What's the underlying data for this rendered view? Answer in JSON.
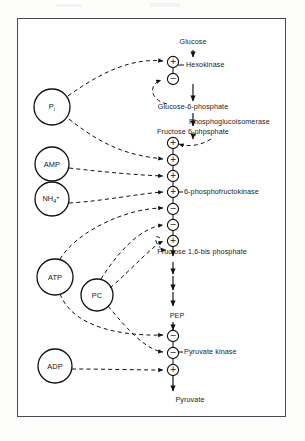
{
  "figure": {
    "type": "pathway-diagram",
    "border_color": "#4a4a52",
    "background": "#ffffff"
  },
  "pathway": {
    "metabolites": [
      {
        "id": "glucose",
        "label": "Glucose",
        "x": 193,
        "y": 45
      },
      {
        "id": "g6p",
        "label": "Glucose-6-phosphate",
        "x": 193,
        "y": 110
      },
      {
        "id": "f6p",
        "label": "Fructose 6-phpsphate",
        "x": 193,
        "y": 134
      },
      {
        "id": "fbp",
        "label": "Fructose 1,6-bis phosphate",
        "x": 202,
        "y": 248
      },
      {
        "id": "pep",
        "label": "PEP",
        "x": 177,
        "y": 318
      },
      {
        "id": "pyruvate",
        "label": "Pyruvate",
        "x": 190,
        "y": 399
      }
    ],
    "enzymes": [
      {
        "id": "hexokinase",
        "label": "Hexokinase",
        "x": 185,
        "y": 65
      },
      {
        "id": "phosphoglucoisomerase",
        "label": "Phosphoglucoisomerase",
        "x": 185,
        "y": 122
      },
      {
        "id": "pfk",
        "label": "6-phosphofructokinase",
        "x": 185,
        "y": 192
      },
      {
        "id": "pyruvate_kinase",
        "label": "Pyruvate kinase",
        "x": 185,
        "y": 352
      }
    ]
  },
  "effectors": [
    {
      "id": "pi",
      "label": "P",
      "sub": "i",
      "sup": "",
      "x": 52,
      "y": 107,
      "r": 18
    },
    {
      "id": "amp",
      "label": "AMP",
      "sub": "",
      "sup": "",
      "x": 52,
      "y": 164,
      "r": 17
    },
    {
      "id": "nh4",
      "label": "NH",
      "sub": "4",
      "sup": "+",
      "x": 52,
      "y": 199,
      "r": 17
    },
    {
      "id": "atp",
      "label": "ATP",
      "sub": "",
      "sup": "",
      "x": 55,
      "y": 277,
      "r": 18
    },
    {
      "id": "pc",
      "label": "PC",
      "sub": "",
      "sup": "",
      "x": 97,
      "y": 295,
      "r": 16
    },
    {
      "id": "adp",
      "label": "ADP",
      "sub": "",
      "sup": "",
      "x": 55,
      "y": 366,
      "r": 17
    }
  ],
  "regulation_nodes": [
    {
      "id": "hk-plus",
      "sign": "+",
      "x": 173,
      "y": 62,
      "enzyme": "hexokinase"
    },
    {
      "id": "hk-minus",
      "sign": "-",
      "x": 173,
      "y": 79,
      "enzyme": "hexokinase"
    },
    {
      "id": "pfk-1",
      "sign": "+",
      "x": 173,
      "y": 143,
      "enzyme": "pfk"
    },
    {
      "id": "pfk-2",
      "sign": "+",
      "x": 173,
      "y": 160,
      "enzyme": "pfk"
    },
    {
      "id": "pfk-3",
      "sign": "+",
      "x": 173,
      "y": 176,
      "enzyme": "pfk"
    },
    {
      "id": "pfk-4",
      "sign": "+",
      "x": 173,
      "y": 192,
      "enzyme": "pfk"
    },
    {
      "id": "pfk-5",
      "sign": "-",
      "x": 173,
      "y": 209,
      "enzyme": "pfk"
    },
    {
      "id": "pfk-6",
      "sign": "-",
      "x": 173,
      "y": 225,
      "enzyme": "pfk"
    },
    {
      "id": "pfk-7",
      "sign": "+",
      "x": 173,
      "y": 241,
      "enzyme": "pfk"
    },
    {
      "id": "pk-1",
      "sign": "-",
      "x": 173,
      "y": 336,
      "enzyme": "pyruvate_kinase"
    },
    {
      "id": "pk-2",
      "sign": "-",
      "x": 173,
      "y": 353,
      "enzyme": "pyruvate_kinase"
    },
    {
      "id": "pk-3",
      "sign": "+",
      "x": 173,
      "y": 370,
      "enzyme": "pyruvate_kinase"
    }
  ],
  "signs": {
    "plus": "+",
    "minus": "−"
  }
}
